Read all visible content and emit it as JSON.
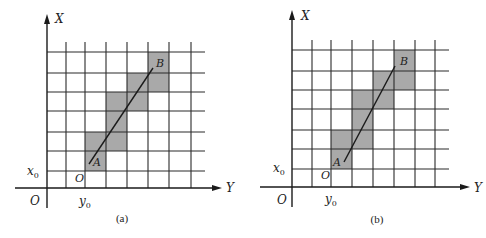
{
  "colors": {
    "line": "#1a1a1a",
    "grid": "#2a2a2a",
    "shade": "#a9a9a9",
    "background": "#ffffff"
  },
  "panels": [
    {
      "id": "a",
      "caption": "(a)",
      "axis_x_label": "X",
      "axis_y_label": "Y",
      "origin_label": "O",
      "x0_label": "x",
      "x0_sub": "0",
      "y0_label": "y",
      "y0_sub": "0",
      "start_label": "O",
      "point_a_label": "A",
      "point_b_label": "B",
      "geometry": {
        "axis_x": 47,
        "axis_y": 188,
        "x_arrow_top": 14,
        "y_arrow_right": 222,
        "vlines": [
          66,
          85,
          106,
          127,
          148,
          169,
          191
        ],
        "hlines": [
          52,
          73,
          92,
          111,
          132,
          151,
          171
        ],
        "grid_left": 47,
        "grid_right": 205,
        "grid_top": 42,
        "grid_bottom": 188,
        "shaded": [
          [
            85,
            132
          ],
          [
            85,
            151
          ],
          [
            106,
            92
          ],
          [
            106,
            111
          ],
          [
            106,
            132
          ],
          [
            127,
            73
          ],
          [
            127,
            92
          ],
          [
            148,
            52
          ],
          [
            148,
            73
          ]
        ],
        "segment": [
          89,
          164,
          153,
          68
        ]
      }
    },
    {
      "id": "b",
      "caption": "(b)",
      "axis_x_label": "X",
      "axis_y_label": "Y",
      "origin_label": "O",
      "x0_label": "x",
      "x0_sub": "0",
      "y0_label": "y",
      "y0_sub": "0",
      "start_label": "O",
      "point_a_label": "A",
      "point_b_label": "B",
      "geometry": {
        "axis_x": 292,
        "axis_y": 187,
        "x_arrow_top": 10,
        "y_arrow_right": 470,
        "vlines": [
          312,
          331,
          352,
          373,
          394,
          415,
          435
        ],
        "hlines": [
          50,
          71,
          90,
          109,
          130,
          149,
          169
        ],
        "grid_left": 292,
        "grid_right": 449,
        "grid_top": 40,
        "grid_bottom": 187,
        "shaded": [
          [
            331,
            130
          ],
          [
            331,
            149
          ],
          [
            352,
            90
          ],
          [
            352,
            109
          ],
          [
            352,
            130
          ],
          [
            373,
            71
          ],
          [
            373,
            90
          ],
          [
            394,
            50
          ],
          [
            394,
            71
          ]
        ],
        "segment": [
          344,
          162,
          395,
          66
        ]
      }
    }
  ]
}
